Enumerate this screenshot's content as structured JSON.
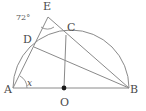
{
  "figure": {
    "type": "geometry-diagram",
    "background_color": "#ffffff",
    "stroke_color": "#8a8a8a",
    "label_color": "#4a4a4a",
    "points": {
      "A": {
        "label": "A",
        "x": 13,
        "y": 88
      },
      "B": {
        "label": "B",
        "x": 129,
        "y": 88
      },
      "O": {
        "label": "O",
        "x": 64,
        "y": 88
      },
      "C": {
        "label": "C",
        "x": 66,
        "y": 35
      },
      "D": {
        "label": "D",
        "x": 34,
        "y": 47
      },
      "E": {
        "label": "E",
        "x": 48,
        "y": 17
      }
    },
    "angles": {
      "at_E": {
        "label": "72°",
        "value": 72,
        "unit": "degrees"
      },
      "at_A": {
        "label": "x",
        "value": null,
        "unit": "degrees"
      }
    },
    "segments": [
      {
        "name": "diameter-AB",
        "from": "A",
        "to": "B"
      },
      {
        "name": "line-A-D-E",
        "from": "A",
        "to": "E"
      },
      {
        "name": "line-E-C-B",
        "from": "E",
        "to": "B"
      },
      {
        "name": "radius-OC",
        "from": "O",
        "to": "C"
      },
      {
        "name": "chord-DB",
        "from": "D",
        "to": "B"
      }
    ],
    "arcs": [
      {
        "name": "semicircle-arc-A-to-B",
        "from": "A",
        "to": "B",
        "center": "O",
        "radius": 58
      }
    ],
    "markers": [
      {
        "name": "center-point-dot",
        "at": "O"
      },
      {
        "name": "angle-arc-at-E",
        "at": "E"
      },
      {
        "name": "angle-arc-at-A",
        "at": "A"
      }
    ]
  }
}
